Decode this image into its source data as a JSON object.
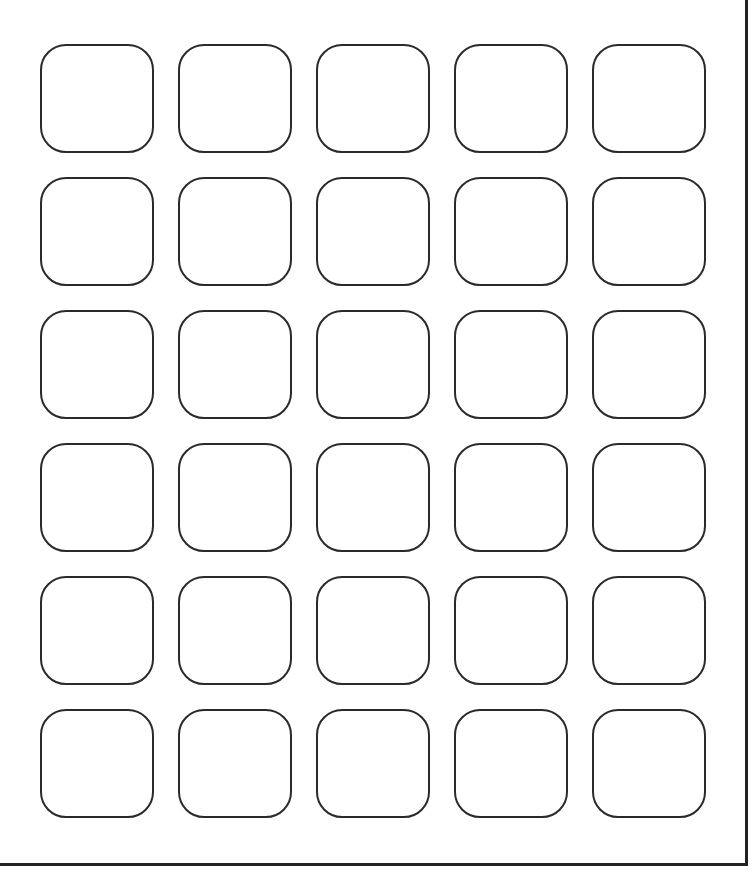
{
  "sheet": {
    "type": "label-template",
    "rows": 6,
    "columns": 5,
    "label_count": 30,
    "border_color": "#2a2a2a",
    "background": "#ffffff"
  }
}
